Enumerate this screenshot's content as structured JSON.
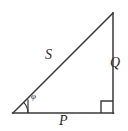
{
  "figure": {
    "type": "geometry-diagram",
    "shape": "right-triangle",
    "background_color": "#ffffff",
    "stroke_color": "#3a3a3a",
    "label_color": "#2b2b2b",
    "labels": {
      "hypotenuse": "S",
      "vertical_leg": "Q",
      "horizontal_leg": "P",
      "angle": "φ"
    },
    "markers": {
      "right_angle": "right-angle-square",
      "angle_arc": "angle-arc"
    },
    "geometry": {
      "vertex_left": [
        13,
        113
      ],
      "vertex_apex": [
        113,
        13
      ],
      "vertex_right": [
        113,
        113
      ],
      "base_length_px": 100,
      "height_px": 100,
      "angle_degrees": 45
    }
  }
}
